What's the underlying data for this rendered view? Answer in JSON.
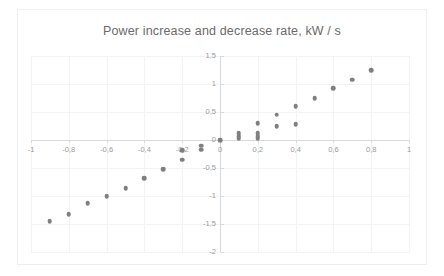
{
  "chart": {
    "title": "Power increase and decrease rate, kW / s"
  },
  "chart_data": {
    "type": "scatter",
    "title": "Power increase and decrease rate, kW / s",
    "xlabel": "",
    "ylabel": "",
    "xlim": [
      -1,
      1
    ],
    "ylim": [
      -2,
      1.5
    ],
    "grid": true,
    "legend": false,
    "decimal_separator": ",",
    "marker_color": "#7f7f7f",
    "xticks": [
      -1,
      -0.8,
      -0.6,
      -0.4,
      -0.2,
      0,
      0.2,
      0.4,
      0.6,
      0.8,
      1
    ],
    "xtick_labels": [
      "-1",
      "-0,8",
      "-0,6",
      "-0,4",
      "-0,2",
      "0",
      "0,2",
      "0,4",
      "0,6",
      "0,8",
      "1"
    ],
    "yticks": [
      1.5,
      1,
      0.5,
      0,
      -0.5,
      -1,
      -1.5,
      -2
    ],
    "ytick_labels": [
      "1,5",
      "1",
      "0,5",
      "0",
      "-0,5",
      "-1",
      "-1,5",
      "-2"
    ],
    "series": [
      {
        "name": "Power rate",
        "points": [
          [
            -0.9,
            -1.45
          ],
          [
            -0.8,
            -1.32
          ],
          [
            -0.7,
            -1.13
          ],
          [
            -0.6,
            -1.0
          ],
          [
            -0.5,
            -0.86
          ],
          [
            -0.4,
            -0.68
          ],
          [
            -0.3,
            -0.52
          ],
          [
            -0.2,
            -0.35
          ],
          [
            -0.2,
            -0.18
          ],
          [
            -0.1,
            -0.1
          ],
          [
            -0.1,
            -0.17
          ],
          [
            0.0,
            0.0
          ],
          [
            0.1,
            0.03
          ],
          [
            0.1,
            0.07
          ],
          [
            0.1,
            0.12
          ],
          [
            0.2,
            0.03
          ],
          [
            0.2,
            0.07
          ],
          [
            0.2,
            0.12
          ],
          [
            0.2,
            0.3
          ],
          [
            0.3,
            0.25
          ],
          [
            0.3,
            0.45
          ],
          [
            0.4,
            0.28
          ],
          [
            0.4,
            0.6
          ],
          [
            0.5,
            0.75
          ],
          [
            0.6,
            0.92
          ],
          [
            0.7,
            1.08
          ],
          [
            0.8,
            1.25
          ]
        ]
      }
    ]
  }
}
